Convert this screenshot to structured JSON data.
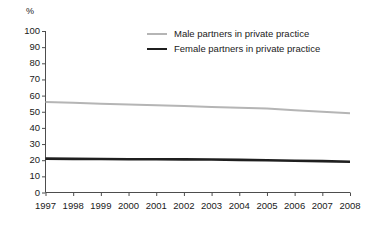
{
  "chart_data": {
    "type": "line",
    "title": "",
    "subtitle": "",
    "xlabel": "",
    "ylabel": "%",
    "unit_label": "%",
    "categories": [
      "1997",
      "1998",
      "1999",
      "2000",
      "2001",
      "2002",
      "2003",
      "2004",
      "2005",
      "2006",
      "2007",
      "2008"
    ],
    "x": [
      1997,
      1998,
      1999,
      2000,
      2001,
      2002,
      2003,
      2004,
      2005,
      2006,
      2007,
      2008
    ],
    "xlim": [
      1997,
      2008
    ],
    "ylim": [
      0,
      100
    ],
    "y_ticks": [
      0,
      10,
      20,
      30,
      40,
      50,
      60,
      70,
      80,
      90,
      100
    ],
    "grid": false,
    "legend_position": "top-center",
    "series": [
      {
        "name": "Male partners in private practice",
        "color": "#b5b5b5",
        "values": [
          56,
          55.5,
          55,
          54.5,
          54,
          53.5,
          53,
          52.5,
          52,
          51,
          50,
          49
        ]
      },
      {
        "name": "Female partners in private practice",
        "color": "#1f1f1f",
        "values": [
          21,
          20.8,
          20.7,
          20.6,
          20.6,
          20.5,
          20.4,
          20.2,
          20,
          19.7,
          19.4,
          19
        ]
      }
    ]
  },
  "legend": {
    "items": [
      {
        "label": "Male partners in private practice"
      },
      {
        "label": "Female partners in private practice"
      }
    ]
  }
}
